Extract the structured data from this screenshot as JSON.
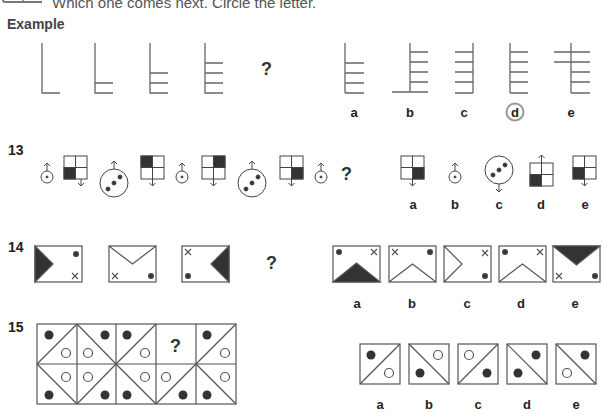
{
  "header": {
    "instruction": "Which one comes next. Circle the letter.",
    "icon": "book-icon",
    "example_heading": "Example"
  },
  "example": {
    "sequence": [
      "L shape, 0 rungs",
      "L shape, 1 rung",
      "L shape, 2 rungs",
      "L shape, 3 rungs"
    ],
    "question_mark": "?",
    "options": [
      {
        "label": "a",
        "desc": "3 rungs, no base"
      },
      {
        "label": "b",
        "desc": "4 rungs, extended base"
      },
      {
        "label": "c",
        "desc": "4 rungs mirrored"
      },
      {
        "label": "d",
        "desc": "4 rungs",
        "circled": true
      },
      {
        "label": "e",
        "desc": "4 rungs crossing"
      }
    ],
    "answer": "d"
  },
  "questions": [
    {
      "number": "13",
      "question_mark": "?",
      "options": [
        {
          "label": "a"
        },
        {
          "label": "b"
        },
        {
          "label": "c"
        },
        {
          "label": "d"
        },
        {
          "label": "e"
        }
      ]
    },
    {
      "number": "14",
      "question_mark": "?",
      "options": [
        {
          "label": "a"
        },
        {
          "label": "b"
        },
        {
          "label": "c"
        },
        {
          "label": "d"
        },
        {
          "label": "e"
        }
      ]
    },
    {
      "number": "15",
      "question_mark": "?",
      "options": [
        {
          "label": "a"
        },
        {
          "label": "b"
        },
        {
          "label": "c"
        },
        {
          "label": "d"
        },
        {
          "label": "e"
        }
      ]
    }
  ],
  "colors": {
    "line": "#555555",
    "fill": "#333333",
    "answer_circle": "#888888"
  }
}
